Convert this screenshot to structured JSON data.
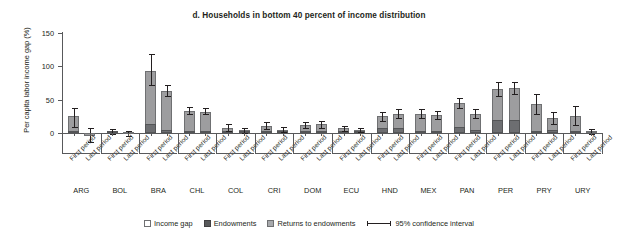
{
  "chart_data": {
    "type": "bar",
    "title": "d. Households in bottom 40 percent of income distribution",
    "xlabel": "",
    "ylabel": "Per capita labor income gap (%)",
    "ylim": [
      -20,
      150
    ],
    "yticks": [
      0,
      50,
      100,
      150
    ],
    "ytick_labels": [
      "0",
      "50",
      "100",
      "150"
    ],
    "grid": false,
    "legend_position": "bottom",
    "stacked": true,
    "period_labels": [
      "First period",
      "Last period"
    ],
    "countries": [
      "ARG",
      "BOL",
      "BRA",
      "CHL",
      "COL",
      "CRI",
      "DOM",
      "ECU",
      "HND",
      "MEX",
      "PAN",
      "PER",
      "PRY",
      "URY"
    ],
    "categories": [
      "ARG First period",
      "ARG Last period",
      "BOL First period",
      "BOL Last period",
      "BRA First period",
      "BRA Last period",
      "CHL First period",
      "CHL Last period",
      "COL First period",
      "COL Last period",
      "CRI First period",
      "CRI Last period",
      "DOM First period",
      "DOM Last period",
      "ECU First period",
      "ECU Last period",
      "HND First period",
      "HND Last period",
      "MEX First period",
      "MEX Last period",
      "PAN First period",
      "PAN Last period",
      "PER First period",
      "PER Last period",
      "PRY First period",
      "PRY Last period",
      "URY First period",
      "URY Last period"
    ],
    "series": [
      {
        "name": "Endowments",
        "color": "#6d6e71",
        "values": [
          2,
          -1,
          1,
          -1,
          13,
          5,
          1,
          1,
          2,
          1,
          2,
          1,
          2,
          2,
          2,
          1,
          7,
          7,
          2,
          2,
          9,
          5,
          20,
          20,
          2,
          4,
          1,
          0
        ]
      },
      {
        "name": "Returns to endowments",
        "color": "#9d9d9f",
        "values": [
          23,
          -3,
          1,
          -1,
          80,
          58,
          32,
          31,
          6,
          3,
          9,
          4,
          10,
          11,
          5,
          3,
          18,
          22,
          27,
          25,
          36,
          24,
          46,
          48,
          42,
          19,
          25,
          2
        ]
      }
    ],
    "totals": [
      25,
      -4,
      2,
      -2,
      93,
      63,
      33,
      32,
      8,
      4,
      11,
      5,
      12,
      13,
      7,
      4,
      25,
      29,
      29,
      27,
      45,
      29,
      66,
      68,
      44,
      23,
      26,
      2
    ],
    "confidence_interval_95": [
      {
        "category": "ARG First period",
        "low": 9,
        "high": 38
      },
      {
        "category": "ARG Last period",
        "low": -14,
        "high": 7
      },
      {
        "category": "BOL First period",
        "low": -2,
        "high": 6
      },
      {
        "category": "BOL Last period",
        "low": -5,
        "high": 3
      },
      {
        "category": "BRA First period",
        "low": 72,
        "high": 118
      },
      {
        "category": "BRA Last period",
        "low": 55,
        "high": 72
      },
      {
        "category": "CHL First period",
        "low": 28,
        "high": 39
      },
      {
        "category": "CHL Last period",
        "low": 28,
        "high": 37
      },
      {
        "category": "COL First period",
        "low": 3,
        "high": 13
      },
      {
        "category": "COL Last period",
        "low": 0,
        "high": 8
      },
      {
        "category": "CRI First period",
        "low": 6,
        "high": 16
      },
      {
        "category": "CRI Last period",
        "low": 1,
        "high": 9
      },
      {
        "category": "DOM First period",
        "low": 7,
        "high": 17
      },
      {
        "category": "DOM Last period",
        "low": 8,
        "high": 18
      },
      {
        "category": "ECU First period",
        "low": 3,
        "high": 11
      },
      {
        "category": "ECU Last period",
        "low": 1,
        "high": 8
      },
      {
        "category": "HND First period",
        "low": 18,
        "high": 32
      },
      {
        "category": "HND Last period",
        "low": 22,
        "high": 36
      },
      {
        "category": "MEX First period",
        "low": 22,
        "high": 36
      },
      {
        "category": "MEX Last period",
        "low": 21,
        "high": 33
      },
      {
        "category": "PAN First period",
        "low": 37,
        "high": 53
      },
      {
        "category": "PAN Last period",
        "low": 22,
        "high": 36
      },
      {
        "category": "PER First period",
        "low": 55,
        "high": 77
      },
      {
        "category": "PER Last period",
        "low": 59,
        "high": 77
      },
      {
        "category": "PRY First period",
        "low": 29,
        "high": 59
      },
      {
        "category": "PRY Last period",
        "low": 14,
        "high": 32
      },
      {
        "category": "URY First period",
        "low": 12,
        "high": 40
      },
      {
        "category": "URY Last period",
        "low": -2,
        "high": 6
      }
    ],
    "legend": [
      {
        "label": "Income gap",
        "swatch": "outline-white"
      },
      {
        "label": "Endowments",
        "swatch": "dark-gray"
      },
      {
        "label": "Returns to endowments",
        "swatch": "light-gray"
      },
      {
        "label": "95% confidence interval",
        "swatch": "error-bar"
      }
    ]
  }
}
